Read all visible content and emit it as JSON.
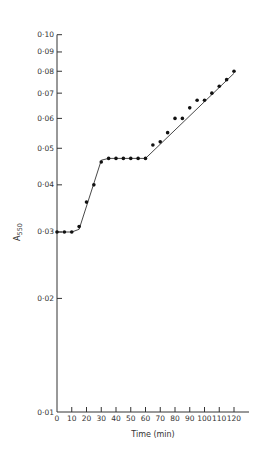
{
  "chart_data": {
    "type": "line",
    "title": "",
    "xlabel": "Time  (min)",
    "ylabel": "A",
    "ylabel_subscript": "550",
    "xscale": "linear",
    "yscale": "log",
    "xlim": [
      0,
      120
    ],
    "ylim": [
      0.01,
      0.1
    ],
    "grid": false,
    "legend": null,
    "x_ticks": [
      0,
      10,
      20,
      30,
      40,
      50,
      60,
      70,
      80,
      90,
      100,
      110,
      120
    ],
    "x_tick_labels": [
      "0",
      "10",
      "20",
      "30",
      "40",
      "50",
      "60",
      "70",
      "80",
      "90",
      "100",
      "110",
      "120"
    ],
    "y_ticks": [
      0.01,
      0.02,
      0.03,
      0.04,
      0.05,
      0.06,
      0.07,
      0.08,
      0.09,
      0.1
    ],
    "y_tick_labels": [
      "0·01",
      "0·02",
      "0·03",
      "0·04",
      "0·05",
      "0·06",
      "0·07",
      "0·08",
      "0·09",
      "0·10"
    ],
    "series": [
      {
        "name": "A550 measurements",
        "style": "points",
        "x": [
          0,
          5,
          10,
          15,
          20,
          25,
          30,
          35,
          40,
          45,
          50,
          55,
          60,
          65,
          70,
          75,
          80,
          85,
          90,
          95,
          100,
          105,
          110,
          115,
          120
        ],
        "values": [
          0.03,
          0.03,
          0.03,
          0.031,
          0.036,
          0.04,
          0.046,
          0.047,
          0.047,
          0.047,
          0.047,
          0.047,
          0.047,
          0.051,
          0.052,
          0.055,
          0.06,
          0.06,
          0.064,
          0.067,
          0.067,
          0.07,
          0.073,
          0.076,
          0.08
        ]
      },
      {
        "name": "fitted curve",
        "style": "line",
        "x": [
          0,
          10,
          15,
          30,
          35,
          60,
          120
        ],
        "values": [
          0.03,
          0.03,
          0.0305,
          0.0465,
          0.047,
          0.047,
          0.079
        ]
      }
    ]
  },
  "colors": {
    "ink": "#333333",
    "background": "#ffffff"
  }
}
